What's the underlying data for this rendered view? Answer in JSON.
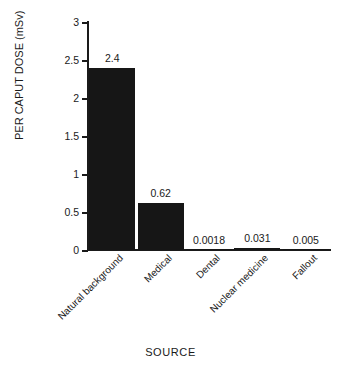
{
  "chart_data": {
    "type": "bar",
    "title": "",
    "xlabel": "SOURCE",
    "ylabel": "PER CAPUT DOSE (mSv)",
    "categories": [
      "Natural background",
      "Medical",
      "Dental",
      "Nuclear medicine",
      "Fallout"
    ],
    "values": [
      2.4,
      0.62,
      0.0018,
      0.031,
      0.005
    ],
    "value_labels": [
      "2.4",
      "0.62",
      "0.0018",
      "0.031",
      "0.005"
    ],
    "ylim": [
      0,
      3
    ],
    "yticks": [
      0,
      0.5,
      1,
      1.5,
      2,
      2.5,
      3
    ],
    "ytick_labels": [
      "0",
      "0.5",
      "1",
      "1.5",
      "2",
      "2.5",
      "3"
    ],
    "grid": false,
    "legend": false,
    "bar_color": "#161616",
    "axis_color": "#1a1a1a",
    "background_color": "#ffffff"
  }
}
